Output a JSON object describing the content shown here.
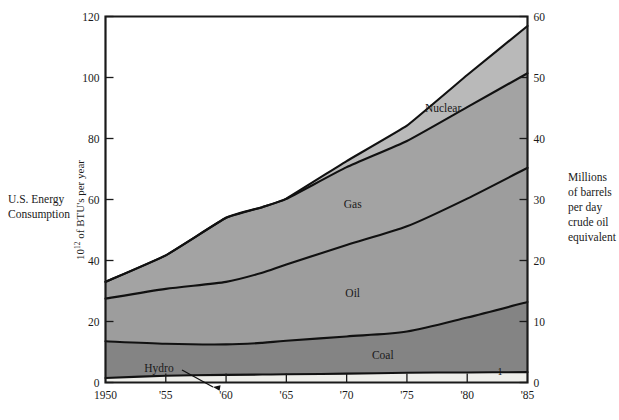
{
  "figure": {
    "left_caption_line1": "U.S. Energy",
    "left_caption_line2": "Consumption",
    "left_axis_title_prefix": "10",
    "left_axis_title_exp": "12",
    "left_axis_title_suffix": " of BTU's per year",
    "right_caption_lines": [
      "Millions",
      "of barrels",
      "per day",
      "crude oil",
      "equivalent"
    ],
    "hydro_callout": "Hydro",
    "stray_mark": "1"
  },
  "chart_data": {
    "type": "area",
    "title": "U.S. Energy Consumption",
    "xlabel": "",
    "ylabel": "10^12 of BTU's per year",
    "y2label": "Millions of barrels per day crude oil equivalent",
    "grid": false,
    "legend": "inline-band-labels",
    "xlim": [
      1950,
      1985
    ],
    "ylim": [
      0,
      120
    ],
    "y2lim": [
      0,
      60
    ],
    "yticks": [
      0,
      20,
      40,
      60,
      80,
      100,
      120
    ],
    "y2ticks": [
      0,
      10,
      20,
      30,
      40,
      50,
      60
    ],
    "xticks": [
      1950,
      1955,
      1960,
      1965,
      1970,
      1975,
      1980,
      1985
    ],
    "xtick_labels": [
      "1950",
      "'55",
      "'60",
      "'65",
      "'70",
      "'75",
      "'80",
      "'85"
    ],
    "ytick_labels": [
      "0",
      "20",
      "40",
      "60",
      "80",
      "100",
      "120"
    ],
    "y2tick_labels": [
      "0",
      "10",
      "20",
      "30",
      "40",
      "50",
      "60"
    ],
    "stacking": "bottom-to-top",
    "x": [
      1950,
      1955,
      1960,
      1963,
      1965,
      1970,
      1975,
      1980,
      1985
    ],
    "series": [
      {
        "name": "Hydro",
        "label": "Hydro",
        "color": "#eeeeea",
        "values": [
          1.5,
          2.2,
          2.5,
          2.6,
          2.7,
          2.9,
          3.2,
          3.3,
          3.4
        ]
      },
      {
        "name": "Coal",
        "label": "Coal",
        "color": "#848484",
        "values": [
          12.0,
          10.5,
          10.0,
          10.4,
          11.0,
          12.2,
          13.5,
          18.0,
          23.0
        ]
      },
      {
        "name": "Oil",
        "label": "Oil",
        "color": "#9d9d9d",
        "values": [
          14.0,
          18.0,
          20.5,
          23.0,
          25.0,
          30.0,
          34.5,
          39.0,
          44.0
        ]
      },
      {
        "name": "Gas",
        "label": "Gas",
        "color": "#a3a3a3",
        "values": [
          5.5,
          11.0,
          21.0,
          21.5,
          21.5,
          25.5,
          28.0,
          30.0,
          31.0
        ]
      },
      {
        "name": "Nuclear",
        "label": "Nuclear",
        "color": "#b9b9b9",
        "values": [
          0,
          0,
          0,
          0,
          0.1,
          2.0,
          5.0,
          10.5,
          15.5
        ]
      }
    ],
    "cumulative_totals": [
      33,
      41.7,
      54,
      57.5,
      60.3,
      72.6,
      84.2,
      100.8,
      117.0
    ]
  }
}
